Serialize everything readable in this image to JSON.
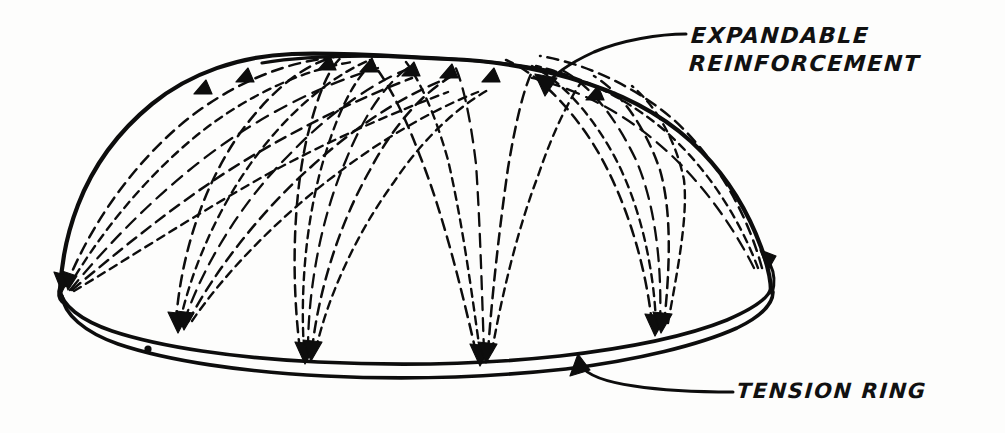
{
  "figure": {
    "domain": "technical-sketch",
    "background_color": "#fdfdfc",
    "ink_color": "#0d0d0d"
  },
  "labels": {
    "expandable": {
      "line1": "EXPANDABLE",
      "line2": "REINFORCEMENT",
      "points_to": "dome shell reinforcement",
      "leader_arrow_direction": "down-left"
    },
    "tension": {
      "line1": "TENSION RING",
      "points_to": "base ring of dome",
      "leader_arrow_direction": "up-left"
    }
  },
  "parts": {
    "dome_outline": "dome-shell-outline",
    "tension_ring_upper": "tension-ring-upper-line",
    "tension_ring_lower": "tension-ring-lower-line",
    "reinforcement_bundles": 5,
    "anchor_points": 5
  }
}
